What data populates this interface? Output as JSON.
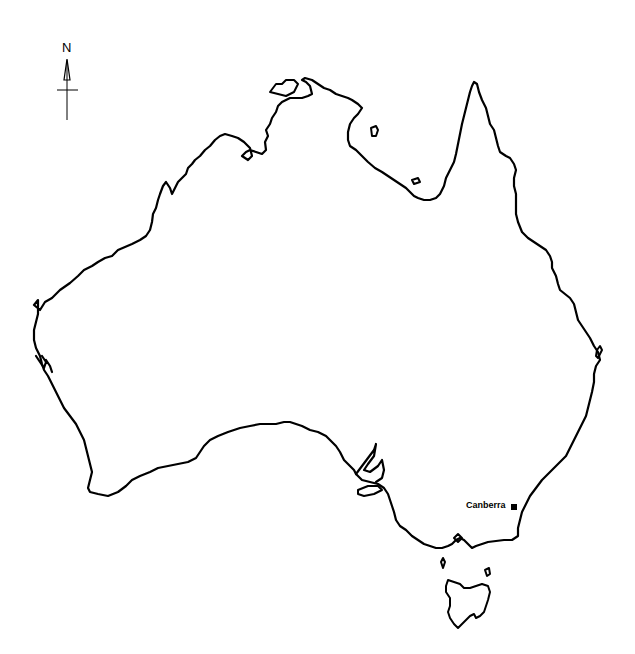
{
  "map": {
    "title": "Australia outline map",
    "subject": "Australia",
    "background_color": "#ffffff",
    "line_color": "#000000"
  },
  "compass": {
    "north_label": "N",
    "icon": "north-arrow-icon"
  },
  "cities": [
    {
      "name": "Canberra",
      "marker": "square-marker-icon",
      "x": 514,
      "y": 507
    }
  ],
  "regions": [
    "mainland",
    "tasmania",
    "kangaroo-island",
    "king-island",
    "flinders-island",
    "melville-island",
    "groote-eylandt",
    "mornington-island"
  ]
}
